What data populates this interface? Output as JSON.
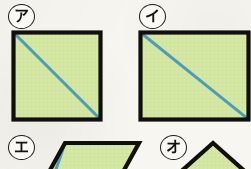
{
  "page": {
    "type": "geometry-worksheet-figures",
    "background_color": "#f7f6f1",
    "width": 251,
    "height": 169
  },
  "style": {
    "fill_color": "#d6e8a5",
    "outline_color": "#100f0c",
    "diagonal_color": "#4d9cb8",
    "badge_border_color": "#1b1b19",
    "badge_fill_color": "#faf9f5",
    "grid_color": "#c7dc92"
  },
  "figures": [
    {
      "id": "a",
      "label": "ア",
      "label_romaji": "a",
      "shape": "square",
      "has_diagonal": true,
      "diagonal_direction": "top-left-to-bottom-right",
      "fill": "#d6e8a5",
      "stroke": "#100f0c",
      "diagonal_stroke": "#4d9cb8",
      "width_px": 92,
      "height_px": 92,
      "position": {
        "left": 11,
        "top": 30
      },
      "badge_position": {
        "left": 8,
        "top": 4
      }
    },
    {
      "id": "i",
      "label": "イ",
      "label_romaji": "i",
      "shape": "rectangle",
      "has_diagonal": true,
      "diagonal_direction": "top-left-to-bottom-right",
      "fill": "#d6e8a5",
      "stroke": "#100f0c",
      "diagonal_stroke": "#4d9cb8",
      "width_px": 113,
      "height_px": 92,
      "position": {
        "left": 138,
        "top": 30
      },
      "badge_position": {
        "left": 139,
        "top": 4
      }
    },
    {
      "id": "e",
      "label": "エ",
      "label_romaji": "e",
      "shape": "parallelogram",
      "has_diagonal": true,
      "diagonal_direction": "top-left-to-bottom-right",
      "fill": "#d6e8a5",
      "stroke": "#100f0c",
      "diagonal_stroke": "#4d9cb8",
      "width_px": 98,
      "height_px": 28,
      "slant_px": 23,
      "position": {
        "left": 42,
        "top": 141
      },
      "badge_position": {
        "left": 8,
        "top": 135
      },
      "clipped": true
    },
    {
      "id": "o",
      "label": "オ",
      "label_romaji": "o",
      "shape": "triangle",
      "has_diagonal": false,
      "fill": "#d6e8a5",
      "stroke": "#100f0c",
      "width_px": 76,
      "height_px": 28,
      "position": {
        "left": 175,
        "top": 141
      },
      "badge_position": {
        "left": 160,
        "top": 135
      },
      "clipped": true
    }
  ]
}
